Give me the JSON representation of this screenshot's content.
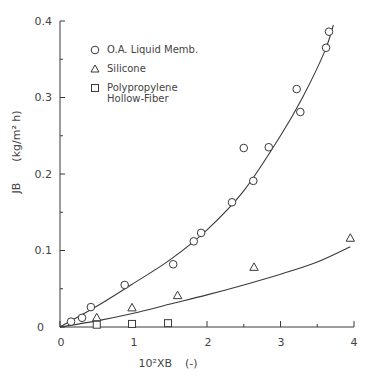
{
  "chart_data": {
    "type": "scatter",
    "title": "",
    "xlabel": "10²XB (-)",
    "ylabel": "JB (kg/m² h)",
    "xlim": [
      0,
      4
    ],
    "ylim": [
      0,
      0.4
    ],
    "x_ticks": [
      "0",
      "1",
      "2",
      "3",
      "4"
    ],
    "y_ticks": [
      "0",
      "0.1",
      "0.2",
      "0.3",
      "0.4"
    ],
    "grid": false,
    "legend_position": "upper-left",
    "series": [
      {
        "name": "O.A. Liquid Memb.",
        "marker": "circle",
        "x": [
          0.15,
          0.3,
          0.42,
          0.88,
          1.54,
          1.82,
          1.92,
          2.34,
          2.5,
          2.63,
          2.84,
          3.22,
          3.27,
          3.62,
          3.66
        ],
        "y": [
          0.007,
          0.012,
          0.026,
          0.055,
          0.082,
          0.112,
          0.123,
          0.163,
          0.234,
          0.191,
          0.235,
          0.311,
          0.281,
          0.365,
          0.386
        ],
        "fit_curve": {
          "x": [
            0,
            0.5,
            1.0,
            1.5,
            2.0,
            2.5,
            3.0,
            3.3,
            3.6,
            3.72
          ],
          "y": [
            0,
            0.027,
            0.057,
            0.088,
            0.127,
            0.178,
            0.25,
            0.3,
            0.36,
            0.395
          ]
        }
      },
      {
        "name": "Silicone",
        "marker": "triangle",
        "x": [
          0.5,
          0.98,
          1.6,
          2.64,
          3.95
        ],
        "y": [
          0.012,
          0.025,
          0.041,
          0.078,
          0.116
        ],
        "fit_curve": {
          "x": [
            0,
            0.5,
            1.0,
            1.5,
            2.0,
            2.5,
            3.0,
            3.5,
            3.95
          ],
          "y": [
            0,
            0.008,
            0.018,
            0.03,
            0.042,
            0.055,
            0.069,
            0.085,
            0.105
          ]
        }
      },
      {
        "name": "Polypropylene Hollow-Fiber",
        "marker": "square",
        "x": [
          0.5,
          0.98,
          1.47
        ],
        "y": [
          0.003,
          0.004,
          0.005
        ]
      }
    ]
  },
  "legend": {
    "items": [
      {
        "label": "O.A. Liquid Memb.",
        "symbol": "circle"
      },
      {
        "label": "Silicone",
        "symbol": "triangle"
      },
      {
        "label_line1": "Polypropylene",
        "label_line2": "Hollow-Fiber",
        "symbol": "square"
      }
    ]
  },
  "axes": {
    "x_title": "10²XB",
    "x_unit": "(-)",
    "y_title": "JB",
    "y_unit": "(kg/m² h)",
    "x_ticks": [
      "0",
      "1",
      "2",
      "3",
      "4"
    ],
    "y_ticks": [
      "0",
      "0.1",
      "0.2",
      "0.3",
      "0.4"
    ],
    "y_zero_label": "0"
  },
  "colors": {
    "ink": "#3a3a3a",
    "background": "#ffffff"
  }
}
